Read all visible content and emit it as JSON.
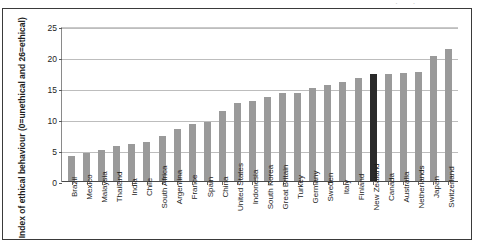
{
  "chart_data": {
    "type": "bar",
    "title": "",
    "subtitle": "",
    "xlabel": "",
    "ylabel": "Index of ethical behaviour (0=unethical and 26=ethical)",
    "ylim": [
      0,
      25
    ],
    "ytick_labels": [
      "0",
      "5",
      "10",
      "15",
      "20",
      "25"
    ],
    "ytick_values": [
      0,
      5,
      10,
      15,
      20,
      25
    ],
    "grid": true,
    "legend": "none",
    "highlight_category": "New Zealand",
    "categories": [
      "Brazil",
      "Mexico",
      "Malaysia",
      "Thailand",
      "India",
      "Chile",
      "South Africa",
      "Argentina",
      "France",
      "Spain",
      "China",
      "United States",
      "Indonesia",
      "South Korea",
      "Great Britain",
      "Turkey",
      "Germany",
      "Sweden",
      "Italy",
      "Finland",
      "New Zealand",
      "Canada",
      "Australia",
      "Netherlands",
      "Japan",
      "Switzerland"
    ],
    "values": [
      4.2,
      4.6,
      5.2,
      5.8,
      6.2,
      6.5,
      7.4,
      8.6,
      9.4,
      9.7,
      11.4,
      12.7,
      13.0,
      13.7,
      14.3,
      14.4,
      15.1,
      15.7,
      16.2,
      16.8,
      17.4,
      17.4,
      17.6,
      17.7,
      20.4,
      21.4
    ]
  },
  "colors": {
    "bar": "#9a9a9a",
    "bar_highlight": "#2a2a2a",
    "gridline": "#bdbdbd",
    "axis": "#4a4a4a",
    "frame": "#3a3a3a",
    "text": "#1d1d1d"
  },
  "artifact": {
    "top_text": "· ·"
  }
}
